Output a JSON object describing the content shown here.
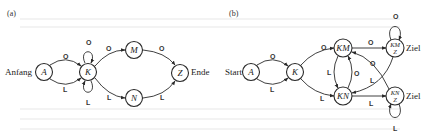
{
  "panel_a": {
    "tag": "(a)",
    "start_label": "Anfang",
    "end_label": "Ende",
    "nodes": {
      "A": "A",
      "K": "K",
      "M": "M",
      "N": "N",
      "Z": "Z"
    },
    "edges": {
      "A_K_top": "O",
      "A_K_bottom": "L",
      "K_loop_top": "O",
      "K_loop_bottom": "L",
      "K_M": "O",
      "K_N": "L",
      "M_Z": "O",
      "N_Z": "L"
    }
  },
  "panel_b": {
    "tag": "(b)",
    "start_label": "Start",
    "goal_label_top": "Ziel",
    "goal_label_bottom": "Ziel",
    "nodes": {
      "A": "A",
      "K": "K",
      "KM": "KM",
      "KN": "KN",
      "KMZ_top": "KM",
      "KMZ_bottom": "Z",
      "KNZ_top": "KN",
      "KNZ_bottom": "Z"
    },
    "edges": {
      "A_K_top": "O",
      "A_K_bottom": "L",
      "K_KM": "O",
      "K_KN": "L",
      "KM_KN": "L",
      "KN_KM": "O",
      "KM_KMZ": "O",
      "KNZ_KM": "O",
      "KMZ_KN": "L",
      "KN_KNZ": "L",
      "KMZ_loop": "O",
      "KNZ_loop": "L"
    }
  }
}
